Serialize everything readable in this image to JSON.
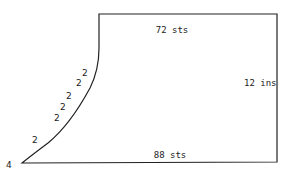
{
  "diagram": {
    "type": "knitting-schematic",
    "labels": {
      "top_width": "72 sts",
      "height": "12 ins",
      "bottom_width": "88 sts",
      "corner_count": "4"
    },
    "decrease_steps": [
      "2",
      "2",
      "2",
      "2",
      "2",
      "2"
    ],
    "colors": {
      "line": "#222222",
      "background": "#ffffff"
    }
  }
}
